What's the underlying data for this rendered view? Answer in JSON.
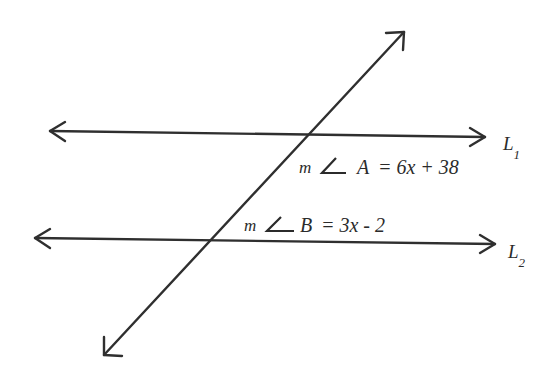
{
  "diagram": {
    "lines": [
      {
        "id": "L1",
        "label_main": "L",
        "label_sub": "1"
      },
      {
        "id": "L2",
        "label_main": "L",
        "label_sub": "2"
      },
      {
        "id": "transversal",
        "label_main": "",
        "label_sub": ""
      }
    ],
    "angles": {
      "A": {
        "prefix": "m",
        "symbol": "∠",
        "name": "A",
        "expression": "= 6x + 38"
      },
      "B": {
        "prefix": "m",
        "symbol": "∠",
        "name": "B",
        "expression": "= 3x - 2"
      }
    },
    "colors": {
      "ink": "#2f2f2f",
      "background": "#ffffff"
    }
  }
}
